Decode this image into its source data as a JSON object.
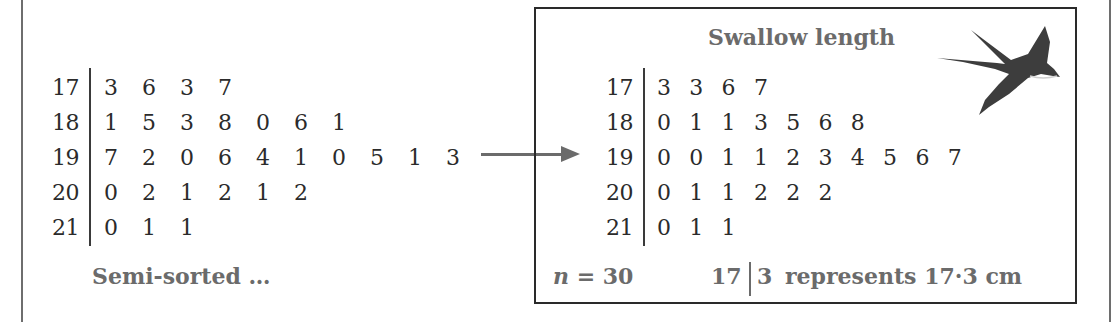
{
  "left_plot": {
    "rows": [
      {
        "stem": "17",
        "leaves": [
          "3",
          "6",
          "3",
          "7"
        ]
      },
      {
        "stem": "18",
        "leaves": [
          "1",
          "5",
          "3",
          "8",
          "0",
          "6",
          "1"
        ]
      },
      {
        "stem": "19",
        "leaves": [
          "7",
          "2",
          "0",
          "6",
          "4",
          "1",
          "0",
          "5",
          "1",
          "3"
        ]
      },
      {
        "stem": "20",
        "leaves": [
          "0",
          "2",
          "1",
          "2",
          "1",
          "2"
        ]
      },
      {
        "stem": "21",
        "leaves": [
          "0",
          "1",
          "1"
        ]
      }
    ],
    "caption": "Semi-sorted …"
  },
  "right_plot": {
    "title": "Swallow length",
    "rows": [
      {
        "stem": "17",
        "leaves": [
          "3",
          "3",
          "6",
          "7"
        ]
      },
      {
        "stem": "18",
        "leaves": [
          "0",
          "1",
          "1",
          "3",
          "5",
          "6",
          "8"
        ]
      },
      {
        "stem": "19",
        "leaves": [
          "0",
          "0",
          "1",
          "1",
          "2",
          "3",
          "4",
          "5",
          "6",
          "7"
        ]
      },
      {
        "stem": "20",
        "leaves": [
          "0",
          "1",
          "1",
          "2",
          "2",
          "2"
        ]
      },
      {
        "stem": "21",
        "leaves": [
          "0",
          "1",
          "1"
        ]
      }
    ],
    "n_label": "n = 30",
    "key": {
      "stem": "17",
      "leaf": "3",
      "text": "represents 17·3 cm"
    }
  },
  "icons": {
    "swallow": "swallow-bird-icon",
    "arrow": "arrow-right-icon"
  },
  "colors": {
    "caption_gray": "#6b6b6b",
    "text": "#2b2b2b",
    "box_border": "#2a2a2a"
  },
  "chart_data": {
    "type": "table",
    "title": "Swallow length",
    "unit": "cm",
    "key": "17 | 3 represents 17.3 cm",
    "n": 30,
    "unsorted": {
      "17": [
        3,
        6,
        3,
        7
      ],
      "18": [
        1,
        5,
        3,
        8,
        0,
        6,
        1
      ],
      "19": [
        7,
        2,
        0,
        6,
        4,
        1,
        0,
        5,
        1,
        3
      ],
      "20": [
        0,
        2,
        1,
        2,
        1,
        2
      ],
      "21": [
        0,
        1,
        1
      ]
    },
    "sorted": {
      "17": [
        3,
        3,
        6,
        7
      ],
      "18": [
        0,
        1,
        1,
        3,
        5,
        6,
        8
      ],
      "19": [
        0,
        0,
        1,
        1,
        2,
        3,
        4,
        5,
        6,
        7
      ],
      "20": [
        0,
        1,
        1,
        2,
        2,
        2
      ],
      "21": [
        0,
        1,
        1
      ]
    }
  }
}
